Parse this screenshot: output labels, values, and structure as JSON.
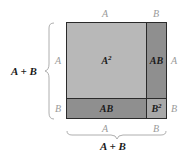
{
  "diagram": {
    "top_labels": [
      "A",
      "B"
    ],
    "right_labels": [
      "A",
      "B"
    ],
    "left_labels": [
      "A",
      "B"
    ],
    "bottom_labels": [
      "A",
      "B"
    ],
    "left_sum": "A + B",
    "bottom_sum": "A + B",
    "regions": {
      "a_squared": {
        "base": "A",
        "exp": "2",
        "color": "#b8b8b8"
      },
      "ab_right": {
        "label": "AB",
        "color": "#8f8f8f"
      },
      "ab_bottom": {
        "label": "AB",
        "color": "#8f8f8f"
      },
      "b_squared": {
        "base": "B",
        "exp": "2",
        "color": "#a8a8a8"
      }
    }
  }
}
